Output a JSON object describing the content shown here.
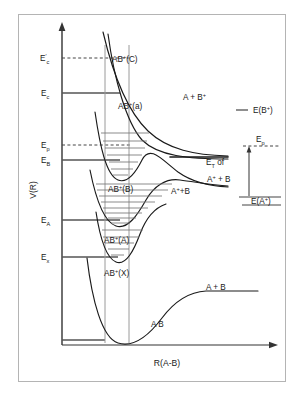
{
  "figure": {
    "kind": "potential-energy-curve-diagram",
    "frame_color": "#b4b4b4",
    "curve_color": "#1a1a1a",
    "level_color": "#555555",
    "vibline_color": "#777777",
    "fc_line_color": "#9a9a9a",
    "dash_color": "#444444",
    "axes": {
      "ylabel": "V(R)",
      "xlabel": "R(A-B)"
    },
    "energy_levels": [
      {
        "id": "Ec_prime",
        "base": "E",
        "sub": "c",
        "prime": "′",
        "style": "dashed",
        "y": 58,
        "x2": 131
      },
      {
        "id": "Ec",
        "base": "E",
        "sub": "c",
        "prime": "",
        "style": "solid",
        "y": 93,
        "x2": 120
      },
      {
        "id": "Ep",
        "base": "E",
        "sub": "p",
        "prime": "",
        "style": "dashed",
        "y": 145,
        "x2": 131
      },
      {
        "id": "EB",
        "base": "E",
        "sub": "B",
        "prime": "",
        "style": "solid",
        "y": 160,
        "x2": 120
      },
      {
        "id": "EA",
        "base": "E",
        "sub": "A",
        "prime": "",
        "style": "solid",
        "y": 220,
        "x2": 120
      },
      {
        "id": "Ex",
        "base": "E",
        "sub": "x",
        "prime": "",
        "style": "solid",
        "y": 257,
        "x2": 118
      },
      {
        "id": "Eground",
        "base": "",
        "sub": "",
        "prime": "",
        "style": "solid",
        "y": 340,
        "x2": 105
      }
    ],
    "curve_labels": [
      {
        "id": "state-C",
        "text": "AB",
        "sup": "+",
        "paren": "(C)",
        "x": 112,
        "y": 62
      },
      {
        "id": "state-a",
        "text": "AB",
        "sup": "+",
        "paren": "(a)",
        "x": 118,
        "y": 109
      },
      {
        "id": "state-B",
        "text": "AB",
        "sup": "+",
        "paren": "(B)",
        "x": 108,
        "y": 192
      },
      {
        "id": "state-A",
        "text": "AB",
        "sup": "+",
        "paren": "(A)",
        "x": 104,
        "y": 243
      },
      {
        "id": "state-X",
        "text": "AB",
        "sup": "+",
        "paren": "(X)",
        "x": 104,
        "y": 276
      },
      {
        "id": "state-AB",
        "text": "A B",
        "sup": "",
        "paren": "",
        "x": 151,
        "y": 327
      }
    ],
    "asymptote_labels": [
      {
        "id": "A-plus-Bplus",
        "pre": "A + B",
        "sup": "+",
        "post": "",
        "x": 183,
        "y": 100
      },
      {
        "id": "Aplus-plus-B",
        "pre": "A",
        "sup": "+",
        "post": "+B",
        "x": 171,
        "y": 194
      },
      {
        "id": "A-plus-B",
        "pre": "A + B",
        "sup": "",
        "post": "",
        "x": 206,
        "y": 290
      }
    ],
    "right_panel": {
      "E_B_plus": {
        "pre": "E(B",
        "sup": "+",
        "post": ")",
        "x": 253,
        "y": 112
      },
      "E_A_plus": {
        "pre": "E(A",
        "sup": "+",
        "post": ")",
        "x": 253,
        "y": 198
      },
      "Ep_label": {
        "base": "E",
        "sub": "p",
        "x": 264,
        "y": 140
      },
      "ET_line1": {
        "base": "E",
        "sub": "T",
        "post": " of",
        "x": 206,
        "y": 165
      },
      "ET_line2": {
        "pre": "A",
        "sup": "+",
        "post": " + B",
        "x": 207,
        "y": 182
      }
    },
    "franck_condon_lines": [
      {
        "id": "fc-left",
        "x": 105
      },
      {
        "id": "fc-right",
        "x": 129
      }
    ],
    "vibrational_levels": {
      "state_B_count": 7,
      "state_A_count": 8,
      "state_X_count": 5
    }
  }
}
